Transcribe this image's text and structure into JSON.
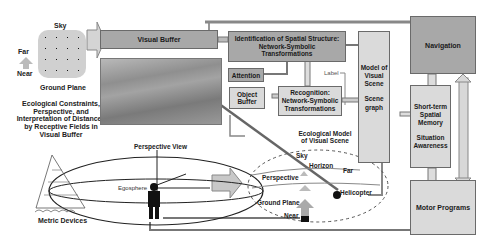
{
  "left_panel": {
    "grid": {
      "top_label": "Sky",
      "bottom_label": "Ground Plane",
      "far_label": "Far",
      "near_label": "Near"
    },
    "caption_lines": [
      "Ecological Constraints,",
      "Perspective, and",
      "Interpretation of Distances",
      "by Receptive Fields in",
      "Visual Buffer"
    ],
    "metric_caption": "Metric Devices"
  },
  "boxes": {
    "visual_buffer": "Visual Buffer",
    "identification": [
      "Identification of Spatial Structure:",
      "Network-Symbolic",
      "Transformations"
    ],
    "attention": "Attention",
    "object_buffer": [
      "Object",
      "Buffer"
    ],
    "recognition": [
      "Recognition:",
      "Network-Symbolic",
      "Transformations"
    ],
    "label": "Label",
    "model_scene": [
      "Model of",
      "Visual",
      "Scene",
      "",
      "Scene",
      "graph"
    ],
    "navigation": "Navigation",
    "short_term": [
      "Short-term",
      "Spatial",
      "Memory",
      "",
      "Situation",
      "Awareness"
    ],
    "motor_programs": "Motor Programs"
  },
  "egosphere": {
    "title": "Perspective View",
    "label": "Egosphere"
  },
  "ecological_model": {
    "title_lines": [
      "Ecological Model",
      "of Visual Scene"
    ],
    "sky": "Sky",
    "horizon": "Horizon",
    "perspective": "Perspective",
    "far": "Far",
    "helicopter": "Helicopter",
    "ground_plane": "Ground Plane",
    "near": "Near"
  },
  "colors": {
    "dark_box": "#a8a8a8",
    "light_box": "#dadada",
    "border": "#6a6a6a",
    "arrow": "#c8c8c8"
  }
}
